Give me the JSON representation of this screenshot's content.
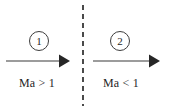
{
  "figure": {
    "width": 173,
    "height": 111,
    "background_color": "#ffffff"
  },
  "divider": {
    "name": "shock-wave-line",
    "style": "dashed",
    "orientation": "vertical",
    "color": "#4a4a4a",
    "x": 83,
    "y_start": 5,
    "y_end": 106,
    "dash_length": 5,
    "gap_length": 4,
    "thickness": 2
  },
  "regions": [
    {
      "id": "region-1",
      "badge": "1",
      "badge_shape": "circle",
      "badge_color": "#3d3d3d",
      "arrow": {
        "name": "flow-arrow-upstream",
        "direction": "right",
        "color": "#3a3a3a",
        "x_start": 6,
        "x_end": 70,
        "y": 61
      },
      "label": "Ma > 1",
      "label_color": "#1f1f1f"
    },
    {
      "id": "region-2",
      "badge": "2",
      "badge_shape": "circle",
      "badge_color": "#3d3d3d",
      "arrow": {
        "name": "flow-arrow-downstream",
        "direction": "right",
        "color": "#3a3a3a",
        "x_start": 93,
        "x_end": 160,
        "y": 61
      },
      "label": "Ma < 1",
      "label_color": "#1f1f1f"
    }
  ]
}
